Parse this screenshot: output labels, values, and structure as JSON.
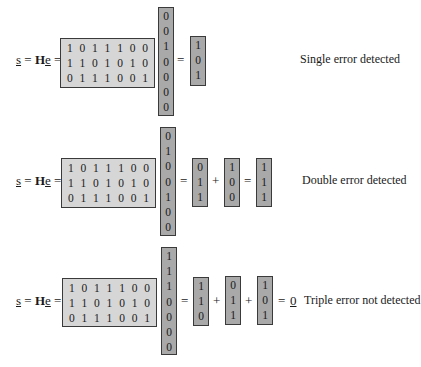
{
  "lhs": {
    "s": "s",
    "eq1": " = ",
    "H": "H",
    "e": "e",
    "eq2": " ="
  },
  "H_matrix": [
    [
      "1",
      "0",
      "1",
      "1",
      "1",
      "0",
      "0"
    ],
    [
      "1",
      "1",
      "0",
      "1",
      "0",
      "1",
      "0"
    ],
    [
      "0",
      "1",
      "1",
      "1",
      "0",
      "0",
      "1"
    ]
  ],
  "panels": [
    {
      "error_vector": [
        "0",
        "0",
        "1",
        "0",
        "0",
        "0",
        "0"
      ],
      "syndromes": [
        [
          "1",
          "0",
          "1"
        ]
      ],
      "ops": [
        "="
      ],
      "label": "Single error detected"
    },
    {
      "error_vector": [
        "0",
        "1",
        "0",
        "0",
        "1",
        "0",
        "0"
      ],
      "syndromes": [
        [
          "0",
          "1",
          "1"
        ],
        [
          "1",
          "0",
          "0"
        ],
        [
          "1",
          "1",
          "1"
        ]
      ],
      "ops": [
        "=",
        "+",
        "="
      ],
      "label": "Double error detected"
    },
    {
      "error_vector": [
        "1",
        "1",
        "1",
        "0",
        "0",
        "0",
        "0"
      ],
      "syndromes": [
        [
          "1",
          "1",
          "0"
        ],
        [
          "0",
          "1",
          "1"
        ],
        [
          "1",
          "0",
          "1"
        ]
      ],
      "ops": [
        "=",
        "+",
        "+",
        "= "
      ],
      "zero": "0",
      "label": "Triple error not detected"
    }
  ],
  "colors": {
    "matrix_fill": "#d6d6d6",
    "vector_fill": "#a9a9a9",
    "border": "#3a3a3a"
  }
}
